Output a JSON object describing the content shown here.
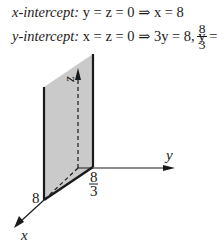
{
  "equations": {
    "x_intercept": {
      "label": "x-intercept:",
      "condition": "y = z = 0",
      "arrow": "⇒",
      "result": "x = 8"
    },
    "y_intercept": {
      "label": "y-intercept:",
      "condition": "x = z = 0",
      "arrow": "⇒",
      "result1": "3y = 8,",
      "result2_lhs": "y =",
      "frac_num": "8",
      "frac_den": "3"
    }
  },
  "figure": {
    "axis_labels": {
      "x": "x",
      "y": "y",
      "z": "z"
    },
    "tick_labels": {
      "x_intercept": "8",
      "y_intercept_num": "8",
      "y_intercept_den": "3"
    },
    "plane_fill": "#c9c9c9"
  }
}
